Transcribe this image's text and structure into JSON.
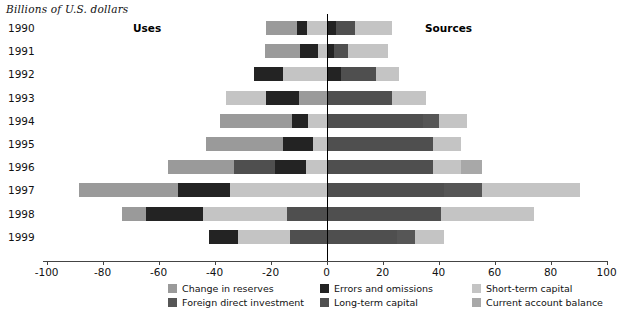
{
  "header": {
    "unit_label": "Billions of U.S. dollars",
    "uses_label": "Uses",
    "sources_label": "Sources"
  },
  "colors": {
    "change_in_reserves": "#9a9a9a",
    "foreign_direct_investment": "#565656",
    "errors_and_omissions": "#232323",
    "long_term_capital": "#4f4f4f",
    "short_term_capital": "#c4c4c4",
    "current_account_balance": "#a8a8a8",
    "axis": "#444444",
    "zero_line": "#000000"
  },
  "legend": {
    "items": [
      {
        "label": "Change in reserves",
        "key": "change_in_reserves",
        "color": "#9a9a9a"
      },
      {
        "label": "Foreign direct investment",
        "key": "foreign_direct_investment",
        "color": "#565656"
      },
      {
        "label": "Errors and omissions",
        "key": "errors_and_omissions",
        "color": "#232323"
      },
      {
        "label": "Long-term capital",
        "key": "long_term_capital",
        "color": "#4f4f4f"
      },
      {
        "label": "Short-term capital",
        "key": "short_term_capital",
        "color": "#c4c4c4"
      },
      {
        "label": "Current account balance",
        "key": "current_account_balance",
        "color": "#a8a8a8"
      }
    ]
  },
  "chart_data": {
    "type": "bar",
    "orientation": "horizontal",
    "subtype": "diverging-stacked",
    "title": "",
    "subtitle": "",
    "xlabel": "Billions of U.S. dollars",
    "ylabel": "",
    "xlim": [
      -100,
      100
    ],
    "xticks": [
      -100,
      -80,
      -60,
      -40,
      -20,
      0,
      20,
      40,
      60,
      80,
      100
    ],
    "xticklabels": [
      "-100",
      "-80",
      "-60",
      "-40",
      "-20",
      "0",
      "20",
      "40",
      "60",
      "80",
      "100"
    ],
    "grid": false,
    "legend_position": "bottom",
    "annotations": [
      "Uses",
      "Sources"
    ],
    "categories": [
      "1990",
      "1991",
      "1992",
      "1993",
      "1994",
      "1995",
      "1996",
      "1997",
      "1998",
      "1999"
    ],
    "series": [
      {
        "name": "Change in reserves",
        "values": [
          -11.0,
          -11.5,
          0.0,
          0.0,
          -25.5,
          -27.5,
          -23.5,
          -35.5,
          -8.5,
          0.0
        ]
      },
      {
        "name": "Foreign direct investment",
        "values": [
          0.0,
          0.0,
          0.0,
          0.0,
          0.0,
          0.0,
          0.0,
          0.0,
          0.0,
          0.0
        ]
      },
      {
        "name": "Errors and omissions",
        "values": [
          -3.5,
          -6.5,
          -10.5,
          -11.0,
          -6.0,
          -10.5,
          -11.0,
          -9.5,
          -20.5,
          -10.5
        ]
      },
      {
        "name": "Short-term capital (uses)",
        "values": [
          -7.0,
          -4.0,
          -15.5,
          -15.0,
          -6.5,
          -5.0,
          -7.5,
          -18.5,
          -44.0,
          -18.5
        ]
      },
      {
        "name": "Long-term capital (uses)",
        "values": [
          0.0,
          0.0,
          0.0,
          -10.0,
          0.0,
          0.0,
          -14.5,
          0.0,
          0.0,
          -13.0
        ]
      },
      {
        "name": "Long-term capital (sources)",
        "values": [
          10.0,
          12.5,
          12.5,
          23.5,
          34.5,
          38.0,
          38.0,
          42.0,
          41.0,
          25.0
        ]
      },
      {
        "name": "Foreign direct investment (sources)",
        "values": [
          6.0,
          5.0,
          5.0,
          5.0,
          5.5,
          10.0,
          10.0,
          13.5,
          0.0,
          6.5
        ]
      },
      {
        "name": "Current account balance",
        "values": [
          0.0,
          0.0,
          0.0,
          0.0,
          0.0,
          0.0,
          0.0,
          0.0,
          0.0,
          0.0
        ]
      },
      {
        "name": "Short-term capital (sources)",
        "values": [
          7.5,
          4.5,
          8.5,
          7.0,
          10.0,
          0.0,
          7.5,
          35.0,
          33.0,
          10.5
        ]
      }
    ],
    "totals_uses": [
      -21.5,
      -22.0,
      -26.0,
      -36.0,
      -38.0,
      -43.0,
      -56.5,
      -88.5,
      -73.0,
      -42.0
    ],
    "totals_sources": [
      23.5,
      22.0,
      26.0,
      35.5,
      50.0,
      48.0,
      55.5,
      90.5,
      74.0,
      42.0
    ],
    "bars": [
      {
        "year": "1990",
        "uses": [
          {
            "key": "change_in_reserves",
            "start": -21.5,
            "end": -10.5
          },
          {
            "key": "errors_and_omissions",
            "start": -10.5,
            "end": -7.0
          },
          {
            "key": "short_term_capital",
            "start": -7.0,
            "end": 0
          }
        ],
        "sources": [
          {
            "key": "errors_and_omissions",
            "start": 0,
            "end": 3.5
          },
          {
            "key": "long_term_capital",
            "start": 3.5,
            "end": 10.0
          },
          {
            "key": "short_term_capital",
            "start": 10.0,
            "end": 23.5
          }
        ]
      },
      {
        "year": "1991",
        "uses": [
          {
            "key": "change_in_reserves",
            "start": -22.0,
            "end": -9.5
          },
          {
            "key": "errors_and_omissions",
            "start": -9.5,
            "end": -3.0
          },
          {
            "key": "short_term_capital",
            "start": -3.0,
            "end": 0
          }
        ],
        "sources": [
          {
            "key": "errors_and_omissions",
            "start": 0,
            "end": 2.5
          },
          {
            "key": "long_term_capital",
            "start": 2.5,
            "end": 7.5
          },
          {
            "key": "short_term_capital",
            "start": 7.5,
            "end": 22.0
          }
        ]
      },
      {
        "year": "1992",
        "uses": [
          {
            "key": "errors_and_omissions",
            "start": -26.0,
            "end": -15.5
          },
          {
            "key": "short_term_capital",
            "start": -15.5,
            "end": 0
          }
        ],
        "sources": [
          {
            "key": "errors_and_omissions",
            "start": 0,
            "end": 5.0
          },
          {
            "key": "long_term_capital",
            "start": 5.0,
            "end": 17.5
          },
          {
            "key": "short_term_capital",
            "start": 17.5,
            "end": 26.0
          }
        ]
      },
      {
        "year": "1993",
        "uses": [
          {
            "key": "short_term_capital",
            "start": -36.0,
            "end": -21.5
          },
          {
            "key": "errors_and_omissions",
            "start": -21.5,
            "end": -10.0
          },
          {
            "key": "change_in_reserves",
            "start": -10.0,
            "end": 0
          }
        ],
        "sources": [
          {
            "key": "long_term_capital",
            "start": 0,
            "end": 23.5
          },
          {
            "key": "short_term_capital",
            "start": 23.5,
            "end": 35.5
          }
        ]
      },
      {
        "year": "1994",
        "uses": [
          {
            "key": "change_in_reserves",
            "start": -38.0,
            "end": -12.5
          },
          {
            "key": "errors_and_omissions",
            "start": -12.5,
            "end": -6.5
          },
          {
            "key": "short_term_capital",
            "start": -6.5,
            "end": 0
          }
        ],
        "sources": [
          {
            "key": "long_term_capital",
            "start": 0,
            "end": 34.5
          },
          {
            "key": "foreign_direct_investment",
            "start": 34.5,
            "end": 40.0
          },
          {
            "key": "short_term_capital",
            "start": 40.0,
            "end": 50.0
          }
        ]
      },
      {
        "year": "1995",
        "uses": [
          {
            "key": "change_in_reserves",
            "start": -43.0,
            "end": -15.5
          },
          {
            "key": "errors_and_omissions",
            "start": -15.5,
            "end": -5.0
          },
          {
            "key": "short_term_capital",
            "start": -5.0,
            "end": 0
          }
        ],
        "sources": [
          {
            "key": "long_term_capital",
            "start": 0,
            "end": 38.0
          },
          {
            "key": "short_term_capital",
            "start": 38.0,
            "end": 48.0
          }
        ]
      },
      {
        "year": "1996",
        "uses": [
          {
            "key": "change_in_reserves",
            "start": -56.5,
            "end": -33.0
          },
          {
            "key": "long_term_capital",
            "start": -33.0,
            "end": -18.5
          },
          {
            "key": "errors_and_omissions",
            "start": -18.5,
            "end": -7.5
          },
          {
            "key": "short_term_capital",
            "start": -7.5,
            "end": 0
          }
        ],
        "sources": [
          {
            "key": "long_term_capital",
            "start": 0,
            "end": 38.0
          },
          {
            "key": "short_term_capital",
            "start": 38.0,
            "end": 48.0
          },
          {
            "key": "current_account_balance",
            "start": 48.0,
            "end": 55.5
          }
        ]
      },
      {
        "year": "1997",
        "uses": [
          {
            "key": "change_in_reserves",
            "start": -88.5,
            "end": -53.0
          },
          {
            "key": "errors_and_omissions",
            "start": -53.0,
            "end": -34.5
          },
          {
            "key": "short_term_capital",
            "start": -34.5,
            "end": 0
          }
        ],
        "sources": [
          {
            "key": "long_term_capital",
            "start": 0,
            "end": 42.0
          },
          {
            "key": "foreign_direct_investment",
            "start": 42.0,
            "end": 55.5
          },
          {
            "key": "short_term_capital",
            "start": 55.5,
            "end": 90.5
          }
        ]
      },
      {
        "year": "1998",
        "uses": [
          {
            "key": "change_in_reserves",
            "start": -73.0,
            "end": -64.5
          },
          {
            "key": "errors_and_omissions",
            "start": -64.5,
            "end": -44.0
          },
          {
            "key": "short_term_capital",
            "start": -44.0,
            "end": -14.0
          },
          {
            "key": "long_term_capital",
            "start": -14.0,
            "end": 0
          }
        ],
        "sources": [
          {
            "key": "long_term_capital",
            "start": 0,
            "end": 41.0
          },
          {
            "key": "short_term_capital",
            "start": 41.0,
            "end": 74.0
          }
        ]
      },
      {
        "year": "1999",
        "uses": [
          {
            "key": "errors_and_omissions",
            "start": -42.0,
            "end": -31.5
          },
          {
            "key": "short_term_capital",
            "start": -31.5,
            "end": -13.0
          },
          {
            "key": "long_term_capital",
            "start": -13.0,
            "end": 0
          }
        ],
        "sources": [
          {
            "key": "long_term_capital",
            "start": 0,
            "end": 25.0
          },
          {
            "key": "foreign_direct_investment",
            "start": 25.0,
            "end": 31.5
          },
          {
            "key": "short_term_capital",
            "start": 31.5,
            "end": 42.0
          }
        ]
      }
    ]
  }
}
